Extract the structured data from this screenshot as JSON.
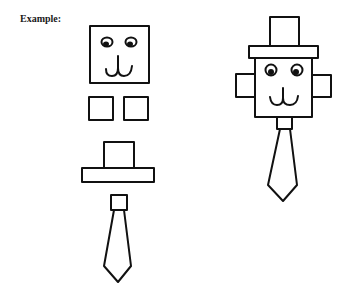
{
  "heading": {
    "label": "Example:"
  },
  "figures": {
    "parts": {
      "name": "separated-parts",
      "items": [
        "face-square",
        "left-ear-square",
        "right-ear-square",
        "top-hat",
        "neck-knot",
        "tie"
      ]
    },
    "assembled": {
      "name": "assembled-figure",
      "items": [
        "top-hat",
        "face-square",
        "left-ear",
        "right-ear",
        "neck-knot",
        "tie"
      ]
    }
  },
  "colors": {
    "ink": "#111111",
    "background": "#ffffff"
  }
}
